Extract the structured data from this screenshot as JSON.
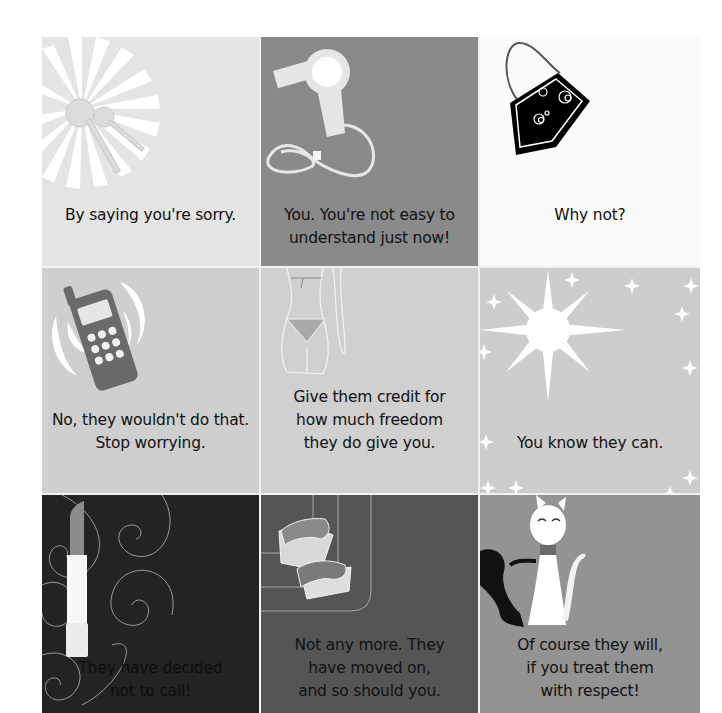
{
  "page": {
    "background": "#ffffff",
    "layout": "3x3 card grid"
  },
  "cards": [
    {
      "illustration": "keys-sunburst",
      "icon": "keys-icon",
      "background": "#e4e4e4",
      "answer": "By saying you're sorry."
    },
    {
      "illustration": "hair-dryer",
      "icon": "hair-dryer-icon",
      "background": "#8a8a8a",
      "answer": "You. You're not easy to\nunderstand just now!"
    },
    {
      "illustration": "handbag",
      "icon": "handbag-icon",
      "background": "#fafafa",
      "answer": "Why not?"
    },
    {
      "illustration": "ringing-mobile-phone",
      "icon": "mobile-phone-icon",
      "background": "#cfcfcf",
      "answer": "No, they wouldn't do that.\nStop worrying."
    },
    {
      "illustration": "bikini-body",
      "icon": "bikini-icon",
      "background": "#d0d0d0",
      "answer": "Give them credit for\nhow much freedom\nthey do give you."
    },
    {
      "illustration": "sparkling-star",
      "icon": "star-icon",
      "background": "#cdcdcd",
      "answer": "You know they can."
    },
    {
      "illustration": "lipstick-swirls",
      "icon": "lipstick-icon",
      "background": "#232323",
      "answer": "They have decided\nnot to call!"
    },
    {
      "illustration": "platform-sandal",
      "icon": "sandal-icon",
      "background": "#555555",
      "answer": "Not any more. They\nhave moved on,\nand so should you."
    },
    {
      "illustration": "white-cat-with-shadow",
      "icon": "cat-icon",
      "background": "#939393",
      "answer": "Of course they will,\nif you treat them\nwith respect!"
    }
  ]
}
